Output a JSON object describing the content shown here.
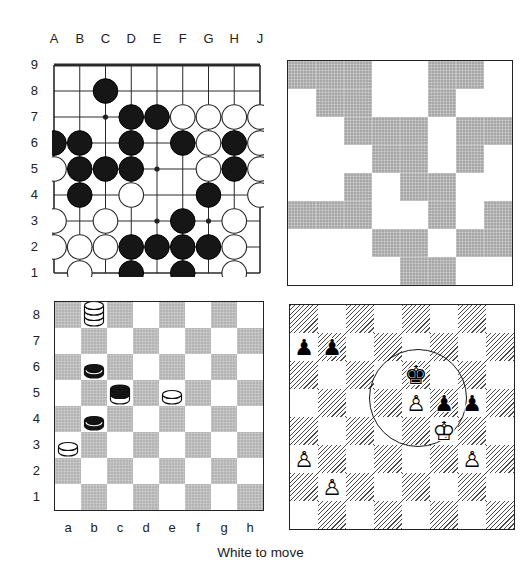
{
  "caption": "White to move",
  "colors": {
    "background": "#ffffff",
    "line": "#2a2a2a",
    "stone_black": "#161616",
    "stone_white": "#ffffff",
    "checker_dark_square": "#b3b3b3",
    "pattern_gray": "#a6a6a6",
    "hatch_line": "#4a4a4a",
    "label_text": "#222222"
  },
  "go_board": {
    "col_labels": [
      "A",
      "B",
      "C",
      "D",
      "E",
      "F",
      "G",
      "H",
      "J"
    ],
    "row_labels": [
      "9",
      "8",
      "7",
      "6",
      "5",
      "4",
      "3",
      "2",
      "1"
    ],
    "black_stones": [
      "C8",
      "D7",
      "E7",
      "A6",
      "B6",
      "D6",
      "F6",
      "H6",
      "B5",
      "C5",
      "D5",
      "H5",
      "B4",
      "G4",
      "F3",
      "D2",
      "E2",
      "F2",
      "G2",
      "D1",
      "F1"
    ],
    "white_stones": [
      "F7",
      "G7",
      "H7",
      "J7",
      "G6",
      "J6",
      "A5",
      "G5",
      "J5",
      "D4",
      "J4",
      "A3",
      "C3",
      "H3",
      "A2",
      "B2",
      "C2",
      "H2",
      "B1",
      "H1"
    ],
    "star_points": [
      "C7",
      "E5",
      "E3",
      "G3"
    ]
  },
  "tile_pattern": {
    "rows": 8,
    "cols": 8,
    "grid": [
      [
        1,
        1,
        1,
        0,
        0,
        1,
        1,
        0
      ],
      [
        0,
        1,
        1,
        0,
        0,
        1,
        0,
        0
      ],
      [
        0,
        0,
        1,
        1,
        1,
        0,
        1,
        1
      ],
      [
        0,
        0,
        0,
        1,
        1,
        0,
        1,
        0
      ],
      [
        0,
        0,
        1,
        0,
        1,
        1,
        0,
        0
      ],
      [
        1,
        1,
        1,
        0,
        0,
        1,
        0,
        1
      ],
      [
        0,
        0,
        0,
        1,
        1,
        0,
        1,
        1
      ],
      [
        0,
        0,
        0,
        0,
        1,
        1,
        0,
        0
      ]
    ]
  },
  "checkers_board": {
    "col_labels": [
      "a",
      "b",
      "c",
      "d",
      "e",
      "f",
      "g",
      "h"
    ],
    "row_labels": [
      "8",
      "7",
      "6",
      "5",
      "4",
      "3",
      "2",
      "1"
    ],
    "pieces": [
      {
        "square": "b8",
        "stack_top_first": [
          "white",
          "white",
          "white"
        ]
      },
      {
        "square": "b6",
        "stack_top_first": [
          "black"
        ]
      },
      {
        "square": "c5",
        "stack_top_first": [
          "black",
          "white"
        ]
      },
      {
        "square": "e5",
        "stack_top_first": [
          "white"
        ]
      },
      {
        "square": "b4",
        "stack_top_first": [
          "black"
        ]
      },
      {
        "square": "a3",
        "stack_top_first": [
          "white"
        ]
      }
    ]
  },
  "chess_board": {
    "pieces": [
      {
        "square": "a7",
        "color": "black",
        "type": "pawn"
      },
      {
        "square": "b7",
        "color": "black",
        "type": "pawn"
      },
      {
        "square": "e6",
        "color": "black",
        "type": "king"
      },
      {
        "square": "e5",
        "color": "white",
        "type": "pawn"
      },
      {
        "square": "f5",
        "color": "black",
        "type": "pawn"
      },
      {
        "square": "g5",
        "color": "black",
        "type": "pawn"
      },
      {
        "square": "f4",
        "color": "white",
        "type": "king"
      },
      {
        "square": "a3",
        "color": "white",
        "type": "pawn"
      },
      {
        "square": "b2",
        "color": "white",
        "type": "pawn"
      },
      {
        "square": "g3",
        "color": "white",
        "type": "pawn"
      }
    ],
    "glyphs": {
      "white_king": "♔",
      "white_pawn": "♙",
      "black_king": "♚",
      "black_pawn": "♟"
    },
    "annotation_circle_squares": [
      "e6",
      "e5",
      "f5",
      "f4"
    ]
  }
}
